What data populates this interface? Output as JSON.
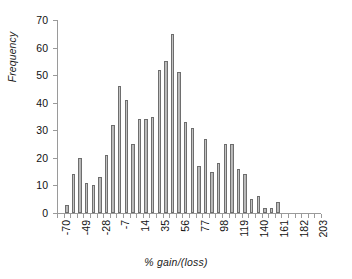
{
  "chart_data": {
    "type": "bar",
    "title": "",
    "subtitle": "",
    "xlabel": "% gain/(loss)",
    "ylabel": "Frequency",
    "ylim": [
      0,
      70
    ],
    "yticks": [
      0,
      10,
      20,
      30,
      40,
      50,
      60,
      70
    ],
    "grid": false,
    "legend": null,
    "xtick_labels": [
      "-70",
      "-49",
      "-28",
      "-7",
      "14",
      "35",
      "56",
      "77",
      "98",
      "119",
      "140",
      "161",
      "182",
      "203"
    ],
    "xtick_step": 21,
    "bin_width": 7,
    "categories": [
      "-70",
      "-63",
      "-56",
      "-49",
      "-42",
      "-35",
      "-28",
      "-21",
      "-14",
      "-7",
      "0",
      "7",
      "14",
      "21",
      "28",
      "35",
      "42",
      "49",
      "56",
      "63",
      "70",
      "77",
      "84",
      "91",
      "98",
      "105",
      "112",
      "119",
      "126",
      "133",
      "140",
      "147",
      "154",
      "161",
      "168",
      "175",
      "182",
      "189",
      "196",
      "203"
    ],
    "values": [
      0,
      3,
      14,
      20,
      11,
      10,
      13,
      21,
      32,
      46,
      41,
      25,
      34,
      34,
      35,
      52,
      55,
      65,
      51,
      33,
      31,
      17,
      27,
      15,
      18,
      25,
      25,
      16,
      14,
      5,
      6,
      2,
      2,
      4,
      0,
      0,
      0,
      0,
      0,
      0
    ],
    "max_value": 65,
    "bar_color": "#bdbdbd",
    "bar_edge_color": "#6e6e6e",
    "axis_color": "#9a9a9a",
    "text_color": "#111111"
  }
}
